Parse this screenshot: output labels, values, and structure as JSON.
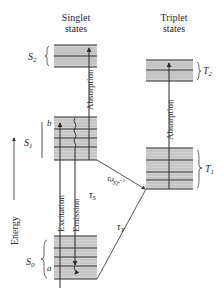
{
  "headers": {
    "singlet_line1": "Singlet",
    "singlet_line2": "states",
    "triplet_line1": "Triplet",
    "triplet_line2": "states"
  },
  "axis": {
    "energy_label": "Energy"
  },
  "states": {
    "S2": {
      "symbol": "S",
      "sub": "2"
    },
    "S1": {
      "symbol": "S",
      "sub": "1"
    },
    "S0": {
      "symbol": "S",
      "sub": "0"
    },
    "T2": {
      "symbol": "T",
      "sub": "2"
    },
    "T1": {
      "symbol": "T",
      "sub": "1"
    }
  },
  "level_markers": {
    "b": "b",
    "a": "a"
  },
  "transitions": {
    "absorption_singlet": "Absorption",
    "absorption_triplet": "Absorption",
    "excitation": "Excitation",
    "emission": "Emission",
    "tau_s": "τ",
    "tau_s_sub": "S",
    "omega_st": "ω",
    "omega_st_sub": "ST",
    "omega_st_sup": "-1",
    "tau_t": "τ",
    "tau_t_sub": "T"
  },
  "colors": {
    "ink": "#2a2a2a",
    "band_fill": "#c8c8c8",
    "background": "#ffffff"
  }
}
